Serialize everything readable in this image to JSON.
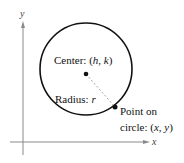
{
  "diagram": {
    "axes": {
      "x_label": "x",
      "y_label": "y"
    },
    "center_label": {
      "prefix": "Center: (",
      "h": "h",
      "sep": ", ",
      "k": "k",
      "suffix": ")"
    },
    "radius_label": {
      "prefix": "Radius: ",
      "r": "r"
    },
    "point_label": {
      "line1": "Point on",
      "line2_prefix": "circle: (",
      "x": "x",
      "sep": ", ",
      "y": "y",
      "suffix": ")"
    },
    "colors": {
      "axis": "#8a8a8a",
      "circle": "#111111",
      "radius": "#aaaaaa"
    }
  }
}
